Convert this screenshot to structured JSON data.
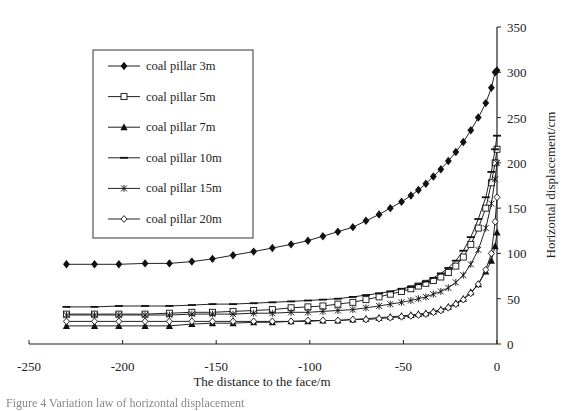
{
  "chart_data": {
    "type": "line",
    "title": "",
    "xlabel": "The distance to the face/m",
    "ylabel": "Horizontal displacement/cm",
    "xlim": [
      -250,
      0
    ],
    "ylim": [
      0,
      350
    ],
    "x_ticks": [
      -250,
      -200,
      -150,
      -100,
      -50,
      0
    ],
    "y_ticks": [
      0,
      50,
      100,
      150,
      200,
      250,
      300,
      350
    ],
    "y_axis_position": "right",
    "grid": false,
    "legend_position": "upper-left-inside",
    "series": [
      {
        "name": "coal pillar 3m",
        "marker": "diamond-filled",
        "x": [
          -230,
          -215,
          -202,
          -188,
          -175,
          -163,
          -152,
          -141,
          -130,
          -120,
          -110,
          -101,
          -93,
          -85,
          -77,
          -70,
          -63,
          -57,
          -51,
          -46,
          -42,
          -38,
          -34,
          -30,
          -26,
          -22,
          -18,
          -14,
          -10,
          -6,
          -3,
          -1,
          0
        ],
        "y": [
          88,
          88,
          88,
          89,
          89,
          91,
          94,
          98,
          102,
          106,
          110,
          114,
          119,
          124,
          129,
          136,
          143,
          150,
          157,
          164,
          170,
          177,
          185,
          193,
          202,
          212,
          223,
          236,
          250,
          266,
          283,
          300,
          302
        ]
      },
      {
        "name": "coal pillar 5m",
        "marker": "square-open",
        "x": [
          -230,
          -215,
          -202,
          -188,
          -175,
          -163,
          -152,
          -141,
          -130,
          -120,
          -110,
          -101,
          -93,
          -85,
          -77,
          -70,
          -63,
          -57,
          -51,
          -46,
          -42,
          -38,
          -34,
          -30,
          -26,
          -22,
          -18,
          -14,
          -10,
          -6,
          -3,
          -1,
          0
        ],
        "y": [
          33,
          33,
          33,
          33,
          34,
          35,
          35,
          36,
          37,
          38,
          40,
          41,
          42,
          44,
          46,
          49,
          52,
          55,
          58,
          61,
          64,
          67,
          70,
          74,
          79,
          86,
          96,
          110,
          128,
          150,
          178,
          200,
          215
        ]
      },
      {
        "name": "coal pillar 7m",
        "marker": "triangle-filled",
        "x": [
          -230,
          -215,
          -202,
          -188,
          -175,
          -163,
          -152,
          -141,
          -130,
          -120,
          -110,
          -101,
          -93,
          -85,
          -77,
          -70,
          -63,
          -57,
          -51,
          -46,
          -42,
          -38,
          -34,
          -30,
          -26,
          -22,
          -18,
          -14,
          -10,
          -6,
          -3,
          -1,
          0
        ],
        "y": [
          20,
          20,
          20,
          20,
          20,
          22,
          23,
          23,
          24,
          24,
          25,
          25,
          26,
          26,
          27,
          28,
          29,
          30,
          31,
          32,
          33,
          34,
          36,
          38,
          41,
          45,
          50,
          57,
          66,
          80,
          92,
          108,
          123
        ]
      },
      {
        "name": "coal pillar 10m",
        "marker": "dash",
        "x": [
          -230,
          -215,
          -202,
          -188,
          -175,
          -163,
          -152,
          -141,
          -130,
          -120,
          -110,
          -101,
          -93,
          -85,
          -77,
          -70,
          -63,
          -57,
          -51,
          -46,
          -42,
          -38,
          -34,
          -30,
          -26,
          -22,
          -18,
          -14,
          -10,
          -6,
          -3,
          -1,
          0
        ],
        "y": [
          41,
          41,
          42,
          42,
          42,
          43,
          44,
          44,
          45,
          46,
          47,
          48,
          49,
          50,
          52,
          54,
          56,
          58,
          61,
          63,
          66,
          69,
          73,
          78,
          84,
          92,
          103,
          118,
          138,
          162,
          190,
          215,
          230
        ]
      },
      {
        "name": "coal pillar 15m",
        "marker": "asterisk",
        "x": [
          -230,
          -215,
          -202,
          -188,
          -175,
          -163,
          -152,
          -141,
          -130,
          -120,
          -110,
          -101,
          -93,
          -85,
          -77,
          -70,
          -63,
          -57,
          -51,
          -46,
          -42,
          -38,
          -34,
          -30,
          -26,
          -22,
          -18,
          -14,
          -10,
          -6,
          -3,
          -1,
          0
        ],
        "y": [
          32,
          32,
          32,
          32,
          32,
          33,
          33,
          33,
          34,
          34,
          35,
          35,
          36,
          37,
          38,
          40,
          42,
          44,
          46,
          48,
          50,
          52,
          55,
          58,
          62,
          68,
          76,
          88,
          104,
          128,
          155,
          182,
          200
        ]
      },
      {
        "name": "coal pillar 20m",
        "marker": "diamond-open",
        "x": [
          -230,
          -215,
          -202,
          -188,
          -175,
          -163,
          -152,
          -141,
          -130,
          -120,
          -110,
          -101,
          -93,
          -85,
          -77,
          -70,
          -63,
          -57,
          -51,
          -46,
          -42,
          -38,
          -34,
          -30,
          -26,
          -22,
          -18,
          -14,
          -10,
          -6,
          -3,
          -1,
          0
        ],
        "y": [
          25,
          25,
          25,
          25,
          25,
          25,
          25,
          25,
          25,
          25,
          25,
          26,
          26,
          26,
          27,
          27,
          28,
          29,
          30,
          31,
          32,
          33,
          35,
          37,
          40,
          44,
          49,
          56,
          66,
          82,
          100,
          135,
          162
        ]
      }
    ]
  },
  "labels": {
    "x_ticks": [
      "-250",
      "-200",
      "-150",
      "-100",
      "-50",
      "0"
    ],
    "y_ticks": [
      "0",
      "50",
      "100",
      "150",
      "200",
      "250",
      "300",
      "350"
    ],
    "xlabel": "The distance to the face/m",
    "ylabel": "Horizontal displacement/cm",
    "legend": [
      "coal pillar 3m",
      "coal pillar 5m",
      "coal pillar 7m",
      "coal pillar 10m",
      "coal pillar 15m",
      "coal pillar 20m"
    ],
    "caption": "Figure 4  Variation law of horizontal displacement"
  }
}
